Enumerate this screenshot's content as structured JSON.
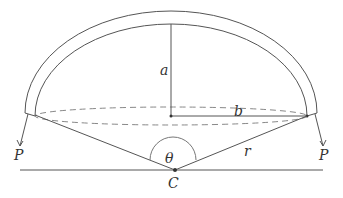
{
  "diagram": {
    "title": "",
    "labels": {
      "a": "a",
      "b": "b",
      "theta": "θ",
      "r": "r",
      "c": "C",
      "p_left": "P",
      "p_right": "P"
    },
    "colors": {
      "stroke": "#555555",
      "dash": "#888888",
      "text": "#333333",
      "background": "#ffffff"
    }
  }
}
